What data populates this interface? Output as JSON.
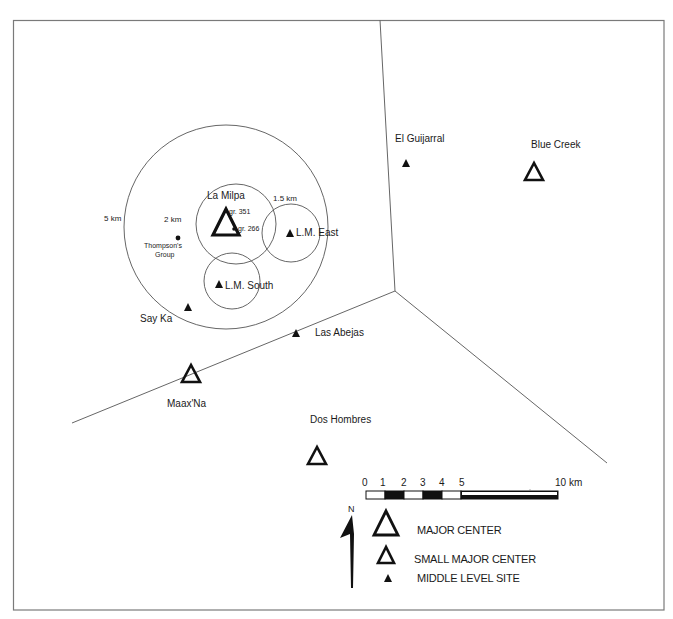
{
  "map": {
    "frame": {
      "left": 13,
      "top": 20,
      "right": 664,
      "bottom": 610,
      "color": "#777777"
    },
    "polygon_lines": [
      {
        "from": [
          380,
          20
        ],
        "to": [
          395,
          291
        ]
      },
      {
        "from": [
          395,
          291
        ],
        "to": [
          72,
          423
        ]
      },
      {
        "from": [
          395,
          291
        ],
        "to": [
          607,
          463
        ]
      }
    ],
    "catchment_circles": [
      {
        "name": "5 km",
        "label": "5 km",
        "cx": 226,
        "cy": 227,
        "r": 102
      },
      {
        "name": "2 km",
        "label": "2 km",
        "cx": 236,
        "cy": 224,
        "r": 40
      },
      {
        "name": "1.5 km",
        "label": "1.5 km",
        "cx": 291,
        "cy": 233,
        "r": 29
      },
      {
        "name": "L.M. South circle",
        "cx": 232,
        "cy": 281,
        "r": 28
      }
    ],
    "sites": [
      {
        "id": "la-milpa",
        "name": "La Milpa",
        "type": "major-center",
        "x": 226,
        "y": 226
      },
      {
        "id": "blue-creek",
        "name": "Blue Creek",
        "type": "small-major-center",
        "x": 534,
        "y": 172
      },
      {
        "id": "maax-na",
        "name": "Maax'Na",
        "type": "small-major-center",
        "x": 191,
        "y": 374
      },
      {
        "id": "dos-hombres",
        "name": "Dos Hombres",
        "type": "small-major-center",
        "x": 317,
        "y": 456
      },
      {
        "id": "el-guijarral",
        "name": "El Guijarral",
        "type": "middle-level-site",
        "x": 406,
        "y": 163
      },
      {
        "id": "lm-east",
        "name": "L.M. East",
        "type": "middle-level-site",
        "x": 290,
        "y": 233
      },
      {
        "id": "lm-south",
        "name": "L.M. South",
        "type": "middle-level-site",
        "x": 219,
        "y": 284
      },
      {
        "id": "say-ka",
        "name": "Say Ka",
        "type": "middle-level-site",
        "x": 188,
        "y": 307
      },
      {
        "id": "las-abejas",
        "name": "Las Abejas",
        "type": "middle-level-site",
        "x": 296,
        "y": 333
      },
      {
        "id": "thompsons-group",
        "name": "Thompson's Group",
        "type": "dot",
        "x": 178,
        "y": 237
      }
    ],
    "labels": {
      "la_milpa": "La Milpa",
      "gr351": "gr. 351",
      "gr266": "gr. 266",
      "lm_east": "L.M. East",
      "lm_south": "L.M. South",
      "say_ka": "Say Ka",
      "thompsons_1": "Thompson's",
      "thompsons_2": "Group",
      "km5": "5 km",
      "km2": "2 km",
      "km15": "1.5 km",
      "el_guijarral": "El Guijarral",
      "blue_creek": "Blue Creek",
      "las_abejas": "Las Abejas",
      "maax_na": "Maax'Na",
      "dos_hombres": "Dos Hombres"
    }
  },
  "scale_bar": {
    "ticks": [
      "0",
      "1",
      "2",
      "3",
      "4",
      "5",
      "10 km"
    ],
    "segments_km": [
      1,
      1,
      1,
      1,
      1,
      5
    ],
    "unit": "km"
  },
  "north_arrow": {
    "label": "N"
  },
  "legend": {
    "items": [
      {
        "symbol": "major-center",
        "label": "MAJOR CENTER"
      },
      {
        "symbol": "small-major-center",
        "label": "SMALL MAJOR CENTER"
      },
      {
        "symbol": "middle-level-site",
        "label": "MIDDLE LEVEL SITE"
      }
    ]
  },
  "colors": {
    "ink": "#111111",
    "lines": "#666666",
    "background": "#ffffff"
  }
}
